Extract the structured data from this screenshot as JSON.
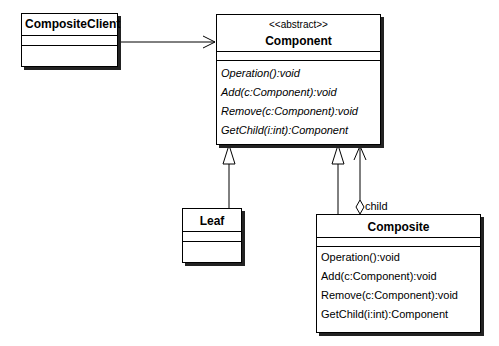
{
  "diagram": {
    "type": "UML class diagram",
    "classes": [
      {
        "id": "composite-client",
        "name": "CompositeClient",
        "stereotype": null,
        "operations": []
      },
      {
        "id": "component",
        "name": "Component",
        "stereotype": "<<abstract>>",
        "abstract": true,
        "operations": [
          "Operation():void",
          "Add(c:Component):void",
          "Remove(c:Component):void",
          "GetChild(i:int):Component"
        ]
      },
      {
        "id": "leaf",
        "name": "Leaf",
        "stereotype": null,
        "operations": []
      },
      {
        "id": "composite",
        "name": "Composite",
        "stereotype": null,
        "operations": [
          "Operation():void",
          "Add(c:Component):void",
          "Remove(c:Component):void",
          "GetChild(i:int):Component"
        ]
      }
    ],
    "relations": [
      {
        "from": "CompositeClient",
        "to": "Component",
        "kind": "association",
        "arrow": "open"
      },
      {
        "from": "Leaf",
        "to": "Component",
        "kind": "generalization"
      },
      {
        "from": "Composite",
        "to": "Component",
        "kind": "generalization"
      },
      {
        "from": "Composite",
        "to": "Component",
        "kind": "aggregation",
        "role": "child"
      }
    ]
  }
}
